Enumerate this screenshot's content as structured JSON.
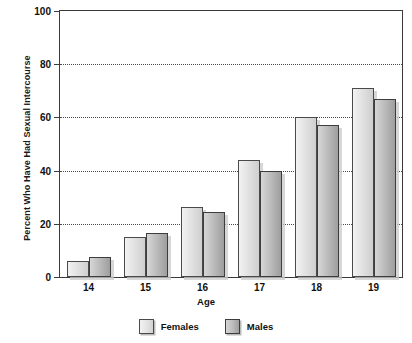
{
  "chart_data": {
    "type": "bar",
    "title": "",
    "xlabel": "Age",
    "ylabel": "Percent Who Have Had Sexual Intercourse",
    "categories": [
      "14",
      "15",
      "16",
      "17",
      "18",
      "19"
    ],
    "series": [
      {
        "name": "Females",
        "values": [
          6,
          15,
          26.5,
          44,
          60,
          71
        ]
      },
      {
        "name": "Males",
        "values": [
          7.5,
          16.5,
          24.5,
          40,
          57,
          67
        ]
      }
    ],
    "ylim": [
      0,
      100
    ],
    "yticks": [
      0,
      20,
      40,
      60,
      80,
      100
    ],
    "ytick_labels": [
      "0",
      "20",
      "40",
      "60",
      "80",
      "100"
    ],
    "grid": true,
    "grid_axis": "y",
    "legend_position": "bottom",
    "legend_entries": [
      "Females",
      "Males"
    ],
    "colors": {
      "female_fill": "#e4e4e4",
      "male_fill": "#bdbdbd",
      "bar_border": "#4a4a4a",
      "gridline": "#4a4a4a",
      "frame": "#3a3a3a",
      "text": "#111111",
      "background": "#ffffff"
    }
  }
}
